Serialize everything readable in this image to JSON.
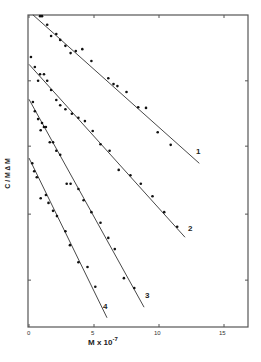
{
  "chart_data": {
    "type": "scatter",
    "title": "",
    "xlabel": "M x 10",
    "xlabel_exponent": "-7",
    "ylabel": "C / M ∆ M",
    "xlim": [
      0,
      17
    ],
    "ylim": [
      0,
      4.73
    ],
    "x_ticks": [
      "0",
      "5",
      "10",
      "15"
    ],
    "y_ticks_unlabeled": [
      0.71,
      1.71,
      2.74,
      3.73
    ],
    "grid": false,
    "legend": "none (series labeled inline 1-4 at line ends)",
    "series": [
      {
        "name": "1",
        "fit_line": [
          [
            0.3,
            4.73
          ],
          [
            13.1,
            2.48
          ]
        ],
        "points": [
          [
            0.85,
            4.71
          ],
          [
            1.0,
            4.71
          ],
          [
            1.4,
            4.58
          ],
          [
            1.7,
            4.41
          ],
          [
            2.1,
            4.44
          ],
          [
            2.4,
            4.35
          ],
          [
            2.8,
            4.26
          ],
          [
            3.2,
            4.15
          ],
          [
            3.6,
            4.18
          ],
          [
            4.1,
            4.21
          ],
          [
            4.8,
            4.03
          ],
          [
            6.1,
            3.77
          ],
          [
            6.5,
            3.68
          ],
          [
            6.8,
            3.65
          ],
          [
            7.5,
            3.56
          ],
          [
            8.4,
            3.33
          ],
          [
            9.0,
            3.32
          ],
          [
            9.9,
            2.95
          ],
          [
            10.9,
            2.76
          ]
        ]
      },
      {
        "name": "2",
        "fit_line": [
          [
            0,
            3.98
          ],
          [
            12.0,
            1.36
          ]
        ],
        "points": [
          [
            0.15,
            4.09
          ],
          [
            0.45,
            3.94
          ],
          [
            0.7,
            3.73
          ],
          [
            0.85,
            3.83
          ],
          [
            1.15,
            3.83
          ],
          [
            1.4,
            3.73
          ],
          [
            1.7,
            3.59
          ],
          [
            2.1,
            3.44
          ],
          [
            2.4,
            3.36
          ],
          [
            2.8,
            3.3
          ],
          [
            3.3,
            3.23
          ],
          [
            3.8,
            3.17
          ],
          [
            4.3,
            3.12
          ],
          [
            4.9,
            2.97
          ],
          [
            5.5,
            2.77
          ],
          [
            6.2,
            2.67
          ],
          [
            6.9,
            2.38
          ],
          [
            7.8,
            2.3
          ],
          [
            8.6,
            2.17
          ],
          [
            9.5,
            1.98
          ],
          [
            10.4,
            1.74
          ],
          [
            11.4,
            1.52
          ]
        ]
      },
      {
        "name": "3",
        "fit_line": [
          [
            0,
            3.45
          ],
          [
            8.85,
            0.3
          ]
        ],
        "points": [
          [
            0.3,
            3.41
          ],
          [
            0.45,
            3.27
          ],
          [
            0.7,
            3.15
          ],
          [
            0.9,
            2.98
          ],
          [
            1.0,
            3.09
          ],
          [
            1.15,
            3.03
          ],
          [
            1.3,
            3.03
          ],
          [
            1.6,
            2.8
          ],
          [
            1.85,
            2.8
          ],
          [
            2.1,
            2.67
          ],
          [
            2.4,
            2.61
          ],
          [
            2.9,
            2.17
          ],
          [
            3.2,
            2.17
          ],
          [
            3.8,
            2.09
          ],
          [
            4.2,
            1.92
          ],
          [
            4.8,
            1.74
          ],
          [
            5.5,
            1.58
          ],
          [
            6.1,
            1.35
          ],
          [
            6.6,
            1.18
          ],
          [
            7.3,
            0.74
          ],
          [
            8.1,
            0.59
          ]
        ]
      },
      {
        "name": "4",
        "fit_line": [
          [
            0,
            2.56
          ],
          [
            6.0,
            0.14
          ]
        ],
        "points": [
          [
            0.25,
            2.48
          ],
          [
            0.4,
            2.36
          ],
          [
            0.6,
            2.27
          ],
          [
            0.9,
            1.95
          ],
          [
            1.3,
            2.0
          ],
          [
            1.5,
            1.88
          ],
          [
            1.85,
            1.76
          ],
          [
            2.15,
            1.68
          ],
          [
            2.8,
            1.45
          ],
          [
            3.15,
            1.24
          ],
          [
            3.8,
            0.98
          ],
          [
            4.5,
            0.91
          ],
          [
            5.1,
            0.61
          ]
        ]
      }
    ]
  },
  "axes": {
    "x_tick_labels": [
      "0",
      "5",
      "10",
      "15"
    ],
    "xlabel_main": "M x 10",
    "xlabel_exp": "-7",
    "ylabel": "C / M ∆ M"
  },
  "series_labels": [
    "1",
    "2",
    "3",
    "4"
  ],
  "style": {
    "line_color": "#333333",
    "point_color": "#111111",
    "frame_color": "#555555"
  }
}
